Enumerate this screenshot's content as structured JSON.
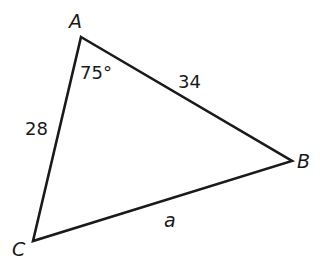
{
  "diagram": {
    "type": "triangle",
    "vertices": {
      "A": {
        "label": "A",
        "x": 81,
        "y": 37
      },
      "B": {
        "label": "B",
        "x": 292,
        "y": 161
      },
      "C": {
        "label": "C",
        "x": 33,
        "y": 241
      }
    },
    "angle_A": "75°",
    "side_AC": "28",
    "side_AB": "34",
    "side_BC": "a",
    "stroke_color": "#1a1a1a"
  }
}
